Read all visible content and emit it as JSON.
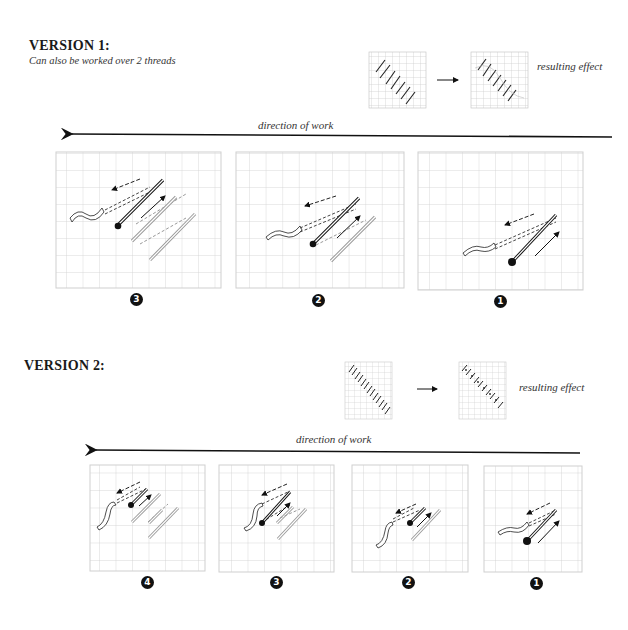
{
  "version1": {
    "title": "VERSION 1:",
    "subtitle": "Can also be worked over 2 threads",
    "result_label": "resulting effect",
    "direction_label": "direction of work",
    "steps": [
      {
        "label": "3",
        "glyph": "❸"
      },
      {
        "label": "2",
        "glyph": "❷"
      },
      {
        "label": "1",
        "glyph": "❶"
      }
    ]
  },
  "version2": {
    "title": "VERSION 2:",
    "result_label": "resulting effect",
    "direction_label": "direction of work",
    "steps": [
      {
        "label": "4",
        "glyph": "❹"
      },
      {
        "label": "3",
        "glyph": "❸"
      },
      {
        "label": "2",
        "glyph": "❷"
      },
      {
        "label": "1",
        "glyph": "❶"
      }
    ]
  },
  "colors": {
    "grid": "#c8c8c8",
    "ink": "#111111",
    "faded_stitch": "#9a9a9a"
  }
}
